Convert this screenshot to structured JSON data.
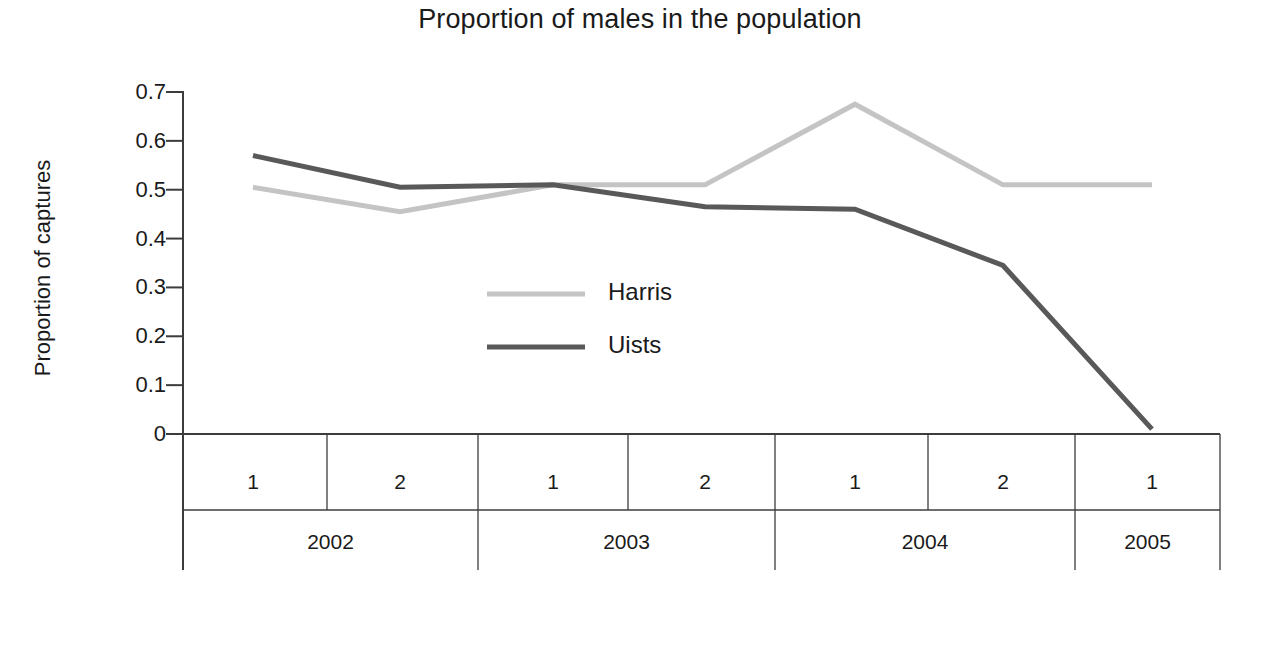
{
  "chart_data": {
    "type": "line",
    "title": "Proportion of males in the population",
    "xlabel": "Year/6 month block",
    "ylabel": "Proportion of captures",
    "grid": false,
    "legend_position": "center-left-inside",
    "ylim": [
      0,
      0.7
    ],
    "ytick_labels": [
      "0.7",
      "0.6",
      "0.5",
      "0.4",
      "0.3",
      "0.2",
      "0.1",
      "0"
    ],
    "ytick_values": [
      0.7,
      0.6,
      0.5,
      0.4,
      0.3,
      0.2,
      0.1,
      0
    ],
    "categories": [
      "2002/1",
      "2002/2",
      "2003/1",
      "2003/2",
      "2004/1",
      "2004/2",
      "2005/1"
    ],
    "x_block_labels": [
      "1",
      "2",
      "1",
      "2",
      "1",
      "2",
      "1"
    ],
    "x_year_groups": [
      {
        "year": "2002",
        "blocks": [
          "1",
          "2"
        ]
      },
      {
        "year": "2003",
        "blocks": [
          "1",
          "2"
        ]
      },
      {
        "year": "2004",
        "blocks": [
          "1",
          "2"
        ]
      },
      {
        "year": "2005",
        "blocks": [
          "1"
        ]
      }
    ],
    "series": [
      {
        "name": "Harris",
        "color": "#c4c4c4",
        "values": [
          0.505,
          0.455,
          0.51,
          0.51,
          0.675,
          0.51,
          0.51
        ]
      },
      {
        "name": "Uists",
        "color": "#595959",
        "values": [
          0.57,
          0.505,
          0.51,
          0.465,
          0.46,
          0.345,
          0.01
        ]
      }
    ]
  },
  "legend": {
    "entries": [
      {
        "label": "Harris",
        "color": "#c4c4c4"
      },
      {
        "label": "Uists",
        "color": "#595959"
      }
    ]
  },
  "axis": {
    "line_color": "#3c3c3c"
  }
}
